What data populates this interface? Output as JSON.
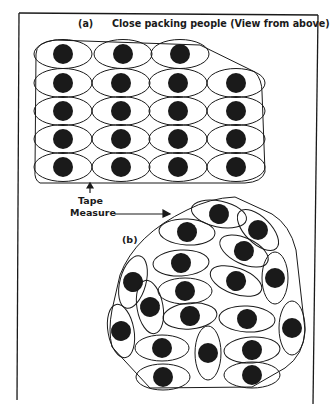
{
  "figure": {
    "panel_a": {
      "label": "(a)",
      "title": "Close packing people (View from above)",
      "rows": [
        3,
        4,
        4,
        4,
        4
      ]
    },
    "annotation": {
      "line1": "Tape",
      "line2": "Measure"
    },
    "panel_b": {
      "label": "(b)",
      "person_count": 22
    },
    "colors": {
      "ink": "#1a1a1a",
      "background": "#ffffff"
    }
  }
}
